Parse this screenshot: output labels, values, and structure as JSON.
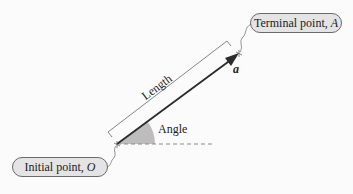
{
  "diagram": {
    "terminal_label": {
      "text": "Terminal point,",
      "symbol": "A"
    },
    "initial_label": {
      "text": "Initial point,",
      "symbol": "O"
    },
    "vector_label": "a",
    "length_label": "Length",
    "angle_label": "Angle",
    "colors": {
      "vector": "#2b2b2b",
      "angle_fill": "#bdbdbd",
      "pill_fill": "#e4e4e4",
      "pill_border": "#6a6a6a",
      "dashed_line": "#8a8a8a"
    }
  }
}
